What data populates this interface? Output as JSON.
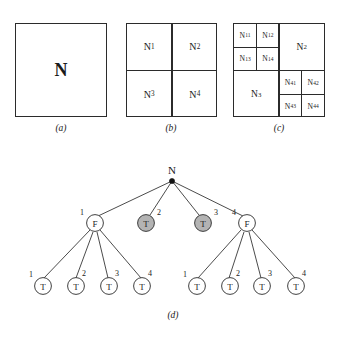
{
  "figure": {
    "panels": [
      {
        "id": "a",
        "caption": "(a)",
        "root_label": "N",
        "cells": []
      },
      {
        "id": "b",
        "caption": "(b)",
        "cells": [
          {
            "base": "N",
            "sub": "1"
          },
          {
            "base": "N",
            "sub": "2"
          },
          {
            "base": "N",
            "sub": "3"
          },
          {
            "base": "N",
            "sub": "4"
          }
        ]
      },
      {
        "id": "c",
        "caption": "(c)",
        "cells": [
          {
            "base": "N",
            "sub": "11"
          },
          {
            "base": "N",
            "sub": "12"
          },
          {
            "base": "N",
            "sub": "13"
          },
          {
            "base": "N",
            "sub": "14"
          },
          {
            "base": "N",
            "sub": "2"
          },
          {
            "base": "N",
            "sub": "3"
          },
          {
            "base": "N",
            "sub": "41"
          },
          {
            "base": "N",
            "sub": "42"
          },
          {
            "base": "N",
            "sub": "43"
          },
          {
            "base": "N",
            "sub": "44"
          }
        ]
      }
    ],
    "tree": {
      "caption": "(d)",
      "root": {
        "label": "N",
        "type": "dot"
      },
      "level1": [
        {
          "index": "1",
          "label": "F",
          "filled": false
        },
        {
          "index": "2",
          "label": "T",
          "filled": true
        },
        {
          "index": "3",
          "label": "T",
          "filled": true
        },
        {
          "index": "4",
          "label": "F",
          "filled": false
        }
      ],
      "level2_left": [
        {
          "index": "1",
          "label": "T",
          "filled": false
        },
        {
          "index": "2",
          "label": "T",
          "filled": false
        },
        {
          "index": "3",
          "label": "T",
          "filled": false
        },
        {
          "index": "4",
          "label": "T",
          "filled": false
        }
      ],
      "level2_right": [
        {
          "index": "1",
          "label": "T",
          "filled": false
        },
        {
          "index": "2",
          "label": "T",
          "filled": false
        },
        {
          "index": "3",
          "label": "T",
          "filled": false
        },
        {
          "index": "4",
          "label": "T",
          "filled": false
        }
      ]
    },
    "colors": {
      "stroke": "#2b2b2b",
      "node_fill_gray": "#b3b3b3",
      "node_fill_white": "#ffffff",
      "text": "#1a1a1a"
    }
  }
}
